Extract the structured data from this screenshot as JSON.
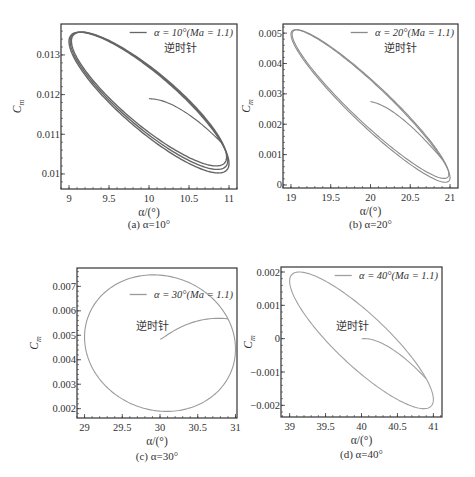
{
  "chart_data": [
    {
      "id": "a",
      "type": "line",
      "caption": "(a) α=10°",
      "xlabel": "α/(°)",
      "ylabel": "Cm",
      "xlim": [
        8.9,
        11.1
      ],
      "ylim": [
        0.00962,
        0.01378
      ],
      "xticks": [
        9,
        9.5,
        10,
        10.5,
        11
      ],
      "xtick_labels": [
        "9",
        "9.5",
        "10",
        "10.5",
        "11"
      ],
      "yticks": [
        0.01,
        0.011,
        0.012,
        0.013
      ],
      "ytick_labels": [
        "0.01",
        "0.011",
        "0.012",
        "0.013"
      ],
      "legend": "α = 10°(Ma = 1.1)",
      "annotation": "逆时针",
      "series_color": "#666666",
      "loop": {
        "center_alpha": 10.0,
        "center_cm": 0.0118,
        "amp_alpha": 1.0,
        "cm_max": 0.01375,
        "cm_min": 0.0102,
        "phase_deg": 150,
        "cycles": 3
      },
      "transient_start": [
        10.0,
        0.0119
      ],
      "grid": false
    },
    {
      "id": "b",
      "type": "line",
      "caption": "(b) α=20°",
      "xlabel": "α/(°)",
      "ylabel": "Cm",
      "xlim": [
        18.9,
        21.1
      ],
      "ylim": [
        -0.0001,
        0.0053
      ],
      "xticks": [
        19,
        19.5,
        20,
        20.5,
        21
      ],
      "xtick_labels": [
        "19",
        "19.5",
        "20",
        "20.5",
        "21"
      ],
      "yticks": [
        0,
        0.001,
        0.002,
        0.003,
        0.004,
        0.005
      ],
      "ytick_labels": [
        "0",
        "0.001",
        "0.002",
        "0.003",
        "0.004",
        "0.005"
      ],
      "legend": "α = 20°(Ma = 1.1)",
      "annotation": "逆时针",
      "series_color": "#8a8a8a",
      "loop": {
        "center_alpha": 20.0,
        "center_cm": 0.0026,
        "amp_alpha": 1.0,
        "cm_max": 0.00512,
        "cm_min": 0.0001,
        "phase_deg": 160,
        "cycles": 2
      },
      "transient_start": [
        20.0,
        0.00275
      ],
      "grid": false
    },
    {
      "id": "c",
      "type": "line",
      "caption": "(c) α=30°",
      "xlabel": "α/(°)",
      "ylabel": "Cm",
      "xlim": [
        28.9,
        31.02
      ],
      "ylim": [
        0.00162,
        0.00775
      ],
      "xticks": [
        29,
        29.5,
        30,
        30.5,
        31
      ],
      "xtick_labels": [
        "29",
        "29.5",
        "30",
        "30.5",
        "31"
      ],
      "yticks": [
        0.002,
        0.003,
        0.004,
        0.005,
        0.006,
        0.007
      ],
      "ytick_labels": [
        "0.002",
        "0.003",
        "0.004",
        "0.005",
        "0.006",
        "0.007"
      ],
      "legend": "α = 30°(Ma = 1.1)",
      "annotation": "逆时针",
      "series_color": "#9a9a9a",
      "loop": {
        "center_alpha": 30.0,
        "center_cm": 0.00468,
        "amp_alpha": 1.0,
        "cm_max": 0.00746,
        "cm_min": 0.00188,
        "phase_deg": 95,
        "cycles": 1
      },
      "transient_start": [
        30.0,
        0.00485
      ],
      "grid": false
    },
    {
      "id": "d",
      "type": "line",
      "caption": "(d) α=40°",
      "xlabel": "α/(°)",
      "ylabel": "Cm",
      "xlim": [
        38.88,
        41.12
      ],
      "ylim": [
        -0.00235,
        0.00215
      ],
      "xticks": [
        39,
        39.5,
        40,
        40.5,
        41
      ],
      "xtick_labels": [
        "39",
        "39.5",
        "40",
        "40.5",
        "41"
      ],
      "yticks": [
        -0.002,
        -0.001,
        0,
        0.001,
        0.002
      ],
      "ytick_labels": [
        "−0.002",
        "−0.001",
        "0",
        "0.001",
        "0.002"
      ],
      "legend": "α = 40°(Ma = 1.1)",
      "annotation": "逆时针",
      "series_color": "#a0a0a0",
      "loop": {
        "center_alpha": 40.0,
        "center_cm": -5e-05,
        "amp_alpha": 1.0,
        "cm_max": 0.00198,
        "cm_min": -0.00212,
        "phase_deg": 150,
        "cycles": 1
      },
      "transient_start": [
        40.0,
        0.0
      ],
      "grid": false
    }
  ],
  "layout": {
    "panels": {
      "a": {
        "left": 61,
        "top": 24,
        "right": 237,
        "bottom": 189,
        "caption_y": 228,
        "legend_y": 36,
        "anno_x": 180,
        "anno_y": 52
      },
      "b": {
        "left": 283,
        "top": 24,
        "right": 458,
        "bottom": 188,
        "caption_y": 228,
        "legend_y": 36,
        "anno_x": 400,
        "anno_y": 52
      },
      "c": {
        "left": 77,
        "top": 268,
        "right": 237,
        "bottom": 418,
        "caption_y": 460,
        "legend_y": 298,
        "anno_x": 152,
        "anno_y": 330
      },
      "d": {
        "left": 281,
        "top": 267,
        "right": 442,
        "bottom": 417,
        "caption_y": 458,
        "legend_y": 279,
        "anno_x": 352,
        "anno_y": 330
      }
    }
  }
}
